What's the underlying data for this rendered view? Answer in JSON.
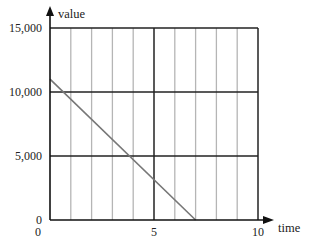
{
  "chart_data": {
    "type": "line",
    "title": "",
    "xlabel": "time",
    "ylabel": "value",
    "xlim": [
      0,
      10
    ],
    "ylim": [
      0,
      15000
    ],
    "x_ticks": [
      0,
      5,
      10
    ],
    "x_tick_labels": [
      "0",
      "5",
      "10"
    ],
    "y_ticks": [
      0,
      5000,
      10000,
      15000
    ],
    "y_tick_labels": [
      "0",
      "5,000",
      "10,000",
      "15,000"
    ],
    "grid": {
      "vertical_minor_step": 1,
      "horizontal_major_step": 5000
    },
    "legend": null,
    "series": [
      {
        "name": "value",
        "x": [
          0,
          7
        ],
        "y": [
          11000,
          0
        ],
        "color": "#777777"
      }
    ]
  },
  "colors": {
    "axis": "#111111",
    "minor_grid": "#b5b5b5",
    "major_grid": "#222222",
    "line": "#777777"
  }
}
